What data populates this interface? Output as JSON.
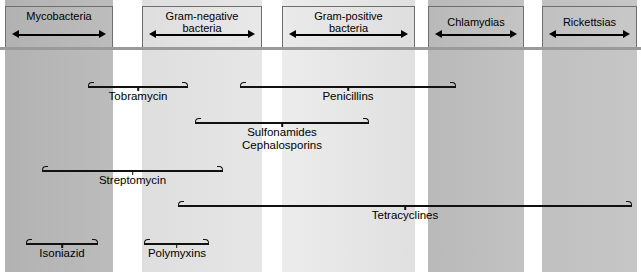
{
  "figure": {
    "width": 641,
    "height": 272,
    "background": "#ffffff"
  },
  "colors": {
    "band_dark": "#b6b6b6",
    "band_light": "#e2e2e2",
    "band_mid": "#d2d2d2",
    "gap": "#ffffff",
    "line": "#111111",
    "separator": "#9a9a9a",
    "header_border": "#6e6e6e"
  },
  "organism_columns": [
    {
      "id": "mycobacteria",
      "label": "Mycobacteria",
      "x": 5,
      "width": 108,
      "shade": "#b6b6b6",
      "header_y": 6,
      "header_height": 42
    },
    {
      "id": "gram-negative",
      "label": "Gram-negative\nbacteria",
      "x": 142,
      "width": 120,
      "shade": "#e2e2e2",
      "header_y": 6,
      "header_height": 42
    },
    {
      "id": "gram-positive",
      "label": "Gram-positive\nbacteria",
      "x": 282,
      "width": 133,
      "shade": "#e2e2e2",
      "header_y": 6,
      "header_height": 42
    },
    {
      "id": "chlamydias",
      "label": "Chlamydias",
      "x": 428,
      "width": 96,
      "shade": "#bdbdbd",
      "header_y": 6,
      "header_height": 42
    },
    {
      "id": "rickettsias",
      "label": "Rickettsias",
      "x": 542,
      "width": 95,
      "shade": "#c3c3c3",
      "header_y": 6,
      "header_height": 42
    }
  ],
  "bands": [
    {
      "id": "band-mycobacteria",
      "x": 5,
      "width": 108,
      "color": "#b6b6b6"
    },
    {
      "id": "band-gram-negative",
      "x": 142,
      "width": 120,
      "color": "#e2e2e2"
    },
    {
      "id": "band-gram-positive",
      "x": 282,
      "width": 133,
      "color": "#e6e6e6"
    },
    {
      "id": "band-chlamydias",
      "x": 428,
      "width": 96,
      "color": "#bdbdbd"
    },
    {
      "id": "band-rickettsias",
      "x": 542,
      "width": 95,
      "color": "#c3c3c3"
    }
  ],
  "separator": {
    "y": 47
  },
  "drugs": [
    {
      "id": "tobramycin",
      "label": "Tobramycin",
      "bracket_x": 88,
      "bracket_width": 100,
      "bracket_y": 82,
      "label_x": 88,
      "label_width": 100,
      "label_y": 90
    },
    {
      "id": "penicillins",
      "label": "Penicillins",
      "bracket_x": 240,
      "bracket_width": 216,
      "bracket_y": 82,
      "label_x": 240,
      "label_width": 216,
      "label_y": 90
    },
    {
      "id": "sulfonamides",
      "label": "Sulfonamides\nCephalosporins",
      "bracket_x": 195,
      "bracket_width": 174,
      "bracket_y": 118,
      "label_x": 195,
      "label_width": 174,
      "label_y": 126
    },
    {
      "id": "streptomycin",
      "label": "Streptomycin",
      "bracket_x": 42,
      "bracket_width": 181,
      "bracket_y": 166,
      "label_x": 42,
      "label_width": 181,
      "label_y": 174
    },
    {
      "id": "tetracyclines",
      "label": "Tetracyclines",
      "bracket_x": 178,
      "bracket_width": 454,
      "bracket_y": 201,
      "label_x": 178,
      "label_width": 454,
      "label_y": 209
    },
    {
      "id": "isoniazid",
      "label": "Isoniazid",
      "bracket_x": 26,
      "bracket_width": 72,
      "bracket_y": 239,
      "label_x": 26,
      "label_width": 72,
      "label_y": 247
    },
    {
      "id": "polymyxins",
      "label": "Polymyxins",
      "bracket_x": 144,
      "bracket_width": 65,
      "bracket_y": 239,
      "label_x": 133,
      "label_width": 88,
      "label_y": 247
    }
  ]
}
